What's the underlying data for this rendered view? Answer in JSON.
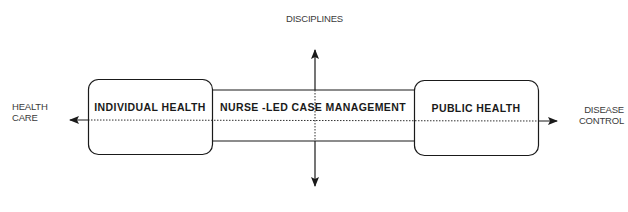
{
  "diagram": {
    "axes": {
      "vertical_top_label": "DISCIPLINES",
      "horizontal_left_label_line1": "HEALTH",
      "horizontal_left_label_line2": "CARE",
      "horizontal_right_label_line1": "DISEASE",
      "horizontal_right_label_line2": "CONTROL"
    },
    "boxes": {
      "left": "INDIVIDUAL HEALTH",
      "center": "NURSE -LED CASE MANAGEMENT",
      "right": "PUBLIC HEALTH"
    },
    "colors": {
      "stroke": "#1a1a1a",
      "text": "#1a1a1a",
      "axis_label": "#3a3a3a"
    }
  }
}
